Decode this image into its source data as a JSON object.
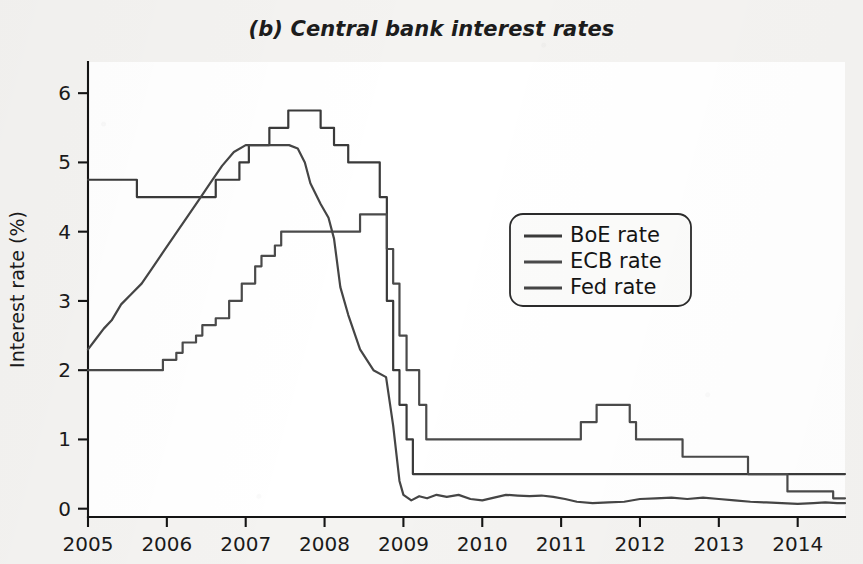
{
  "figure": {
    "panel_label": "(b)",
    "title": "(b) Central bank interest rates"
  },
  "chart_data": {
    "type": "line",
    "title": "(b) Central bank interest rates",
    "xlabel": "",
    "ylabel": "Interest rate (%)",
    "xlim": [
      2005.0,
      2014.6
    ],
    "ylim": [
      -0.12,
      6.45
    ],
    "grid": false,
    "legend_position": "center-right",
    "x_ticks": [
      2005,
      2006,
      2007,
      2008,
      2009,
      2010,
      2011,
      2012,
      2013,
      2014
    ],
    "x_tick_labels": [
      "2005",
      "2006",
      "2007",
      "2008",
      "2009",
      "2010",
      "2011",
      "2012",
      "2013",
      "2014"
    ],
    "y_ticks": [
      0,
      1,
      2,
      3,
      4,
      5,
      6
    ],
    "y_tick_labels": [
      "0",
      "1",
      "2",
      "3",
      "4",
      "5",
      "6"
    ],
    "series": [
      {
        "name": "BoE rate",
        "color": "#3a3a3a",
        "step": "post",
        "x": [
          2005.0,
          2005.62,
          2005.62,
          2006.62,
          2006.62,
          2006.92,
          2006.92,
          2007.04,
          2007.04,
          2007.3,
          2007.3,
          2007.54,
          2007.54,
          2007.95,
          2007.95,
          2008.12,
          2008.12,
          2008.3,
          2008.3,
          2008.7,
          2008.7,
          2008.79,
          2008.79,
          2008.87,
          2008.87,
          2008.95,
          2008.95,
          2009.04,
          2009.04,
          2009.12,
          2009.12,
          2009.2,
          2009.2,
          2014.6
        ],
        "y": [
          4.75,
          4.75,
          4.5,
          4.5,
          4.75,
          4.75,
          5.0,
          5.0,
          5.25,
          5.25,
          5.5,
          5.5,
          5.75,
          5.75,
          5.5,
          5.5,
          5.25,
          5.25,
          5.0,
          5.0,
          4.5,
          4.5,
          3.0,
          3.0,
          2.0,
          2.0,
          1.5,
          1.5,
          1.0,
          1.0,
          0.5,
          0.5,
          0.5,
          0.5
        ]
      },
      {
        "name": "ECB rate",
        "color": "#4a4a4a",
        "step": "post",
        "x": [
          2005.0,
          2005.95,
          2005.95,
          2006.12,
          2006.12,
          2006.2,
          2006.2,
          2006.37,
          2006.37,
          2006.45,
          2006.45,
          2006.62,
          2006.62,
          2006.79,
          2006.79,
          2006.95,
          2006.95,
          2007.12,
          2007.12,
          2007.2,
          2007.2,
          2007.37,
          2007.37,
          2007.45,
          2007.45,
          2008.45,
          2008.45,
          2008.79,
          2008.79,
          2008.87,
          2008.87,
          2008.95,
          2008.95,
          2009.04,
          2009.04,
          2009.2,
          2009.2,
          2009.29,
          2009.29,
          2009.37,
          2009.37,
          2011.25,
          2011.25,
          2011.45,
          2011.45,
          2011.87,
          2011.87,
          2011.95,
          2011.95,
          2012.54,
          2012.54,
          2013.37,
          2013.37,
          2013.87,
          2013.87,
          2014.45,
          2014.45,
          2014.6
        ],
        "y": [
          2.0,
          2.0,
          2.15,
          2.15,
          2.25,
          2.25,
          2.4,
          2.4,
          2.5,
          2.5,
          2.65,
          2.65,
          2.75,
          2.75,
          3.0,
          3.0,
          3.25,
          3.25,
          3.5,
          3.5,
          3.65,
          3.65,
          3.8,
          3.8,
          4.0,
          4.0,
          4.25,
          4.25,
          3.75,
          3.75,
          3.25,
          3.25,
          2.5,
          2.5,
          2.0,
          2.0,
          1.5,
          1.5,
          1.0,
          1.0,
          1.0,
          1.0,
          1.25,
          1.25,
          1.5,
          1.5,
          1.25,
          1.25,
          1.0,
          1.0,
          0.75,
          0.75,
          0.5,
          0.5,
          0.25,
          0.25,
          0.15,
          0.15
        ]
      },
      {
        "name": "Fed rate",
        "color": "#454545",
        "step": "linear",
        "x": [
          2005.0,
          2005.1,
          2005.2,
          2005.3,
          2005.42,
          2005.55,
          2005.68,
          2005.8,
          2005.95,
          2006.1,
          2006.25,
          2006.4,
          2006.55,
          2006.7,
          2006.85,
          2007.0,
          2007.2,
          2007.4,
          2007.55,
          2007.66,
          2007.75,
          2007.82,
          2007.95,
          2008.05,
          2008.12,
          2008.2,
          2008.3,
          2008.45,
          2008.62,
          2008.78,
          2008.87,
          2008.95,
          2009.0,
          2009.1,
          2009.2,
          2009.3,
          2009.42,
          2009.55,
          2009.7,
          2009.85,
          2010.0,
          2010.15,
          2010.3,
          2010.45,
          2010.6,
          2010.75,
          2010.9,
          2011.05,
          2011.2,
          2011.4,
          2011.6,
          2011.8,
          2012.0,
          2012.2,
          2012.4,
          2012.6,
          2012.8,
          2013.0,
          2013.2,
          2013.4,
          2013.6,
          2013.8,
          2014.0,
          2014.2,
          2014.35,
          2014.5,
          2014.6
        ],
        "y": [
          2.3,
          2.45,
          2.6,
          2.72,
          2.95,
          3.1,
          3.25,
          3.45,
          3.7,
          3.95,
          4.2,
          4.45,
          4.7,
          4.95,
          5.15,
          5.25,
          5.25,
          5.25,
          5.25,
          5.2,
          5.0,
          4.7,
          4.4,
          4.2,
          3.9,
          3.2,
          2.8,
          2.3,
          2.0,
          1.9,
          1.2,
          0.4,
          0.2,
          0.12,
          0.18,
          0.15,
          0.2,
          0.17,
          0.2,
          0.14,
          0.12,
          0.16,
          0.2,
          0.19,
          0.18,
          0.19,
          0.17,
          0.14,
          0.1,
          0.08,
          0.09,
          0.1,
          0.14,
          0.15,
          0.16,
          0.14,
          0.16,
          0.14,
          0.12,
          0.1,
          0.09,
          0.08,
          0.07,
          0.08,
          0.09,
          0.08,
          0.08
        ]
      }
    ]
  },
  "legend": {
    "entries": [
      {
        "label": "BoE rate",
        "color": "#3a3a3a"
      },
      {
        "label": "ECB rate",
        "color": "#4a4a4a"
      },
      {
        "label": "Fed rate",
        "color": "#454545"
      }
    ]
  },
  "colors": {
    "page_background": "#f4f3f1",
    "plot_background": "#ffffff",
    "axis": "#141414",
    "text": "#1a1a1a"
  }
}
